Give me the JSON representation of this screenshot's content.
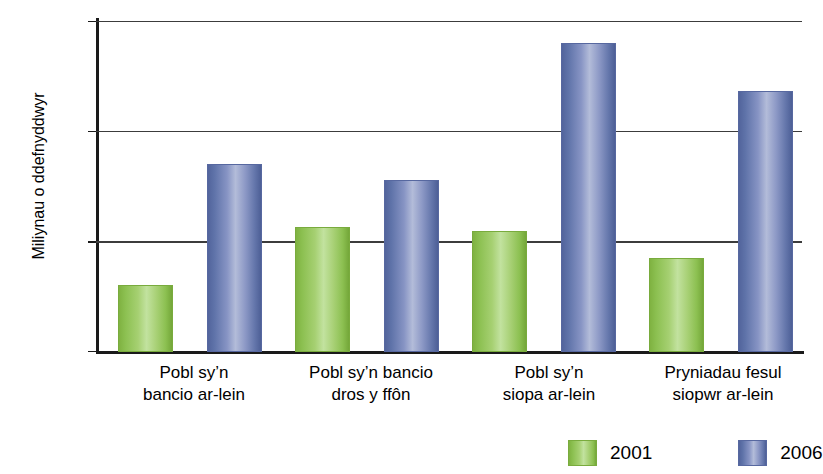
{
  "chart_data": {
    "type": "bar",
    "title": "",
    "xlabel": "",
    "ylabel": "Miliynau o ddefnyddwyr",
    "ylim": [
      0,
      30
    ],
    "yticks": [
      0,
      10,
      20,
      30
    ],
    "ytick_labels": [
      "0",
      "10",
      "20",
      "30"
    ],
    "grid": true,
    "legend_position": "bottom-right",
    "categories": [
      "Pobl sy'n bancio ar-lein",
      "Pobl sy'n bancio dros y ffôn",
      "Pobl sy'n siopa ar-lein",
      "Pryniadau fesul siopwr ar-lein"
    ],
    "category_lines": [
      {
        "line1": "Pobl sy’n",
        "line2": "bancio ar-lein"
      },
      {
        "line1": "Pobl sy’n bancio",
        "line2": "dros y ffôn"
      },
      {
        "line1": "Pobl sy’n",
        "line2": "siopa ar-lein"
      },
      {
        "line1": "Pryniadau fesul",
        "line2": "siopwr ar-lein"
      }
    ],
    "series": [
      {
        "name": "2001",
        "color": "#8CC051",
        "values": [
          6.1,
          11.3,
          11.0,
          8.5
        ]
      },
      {
        "name": "2006",
        "color": "#5F73A9",
        "values": [
          17.0,
          15.6,
          28.0,
          23.7
        ]
      }
    ]
  },
  "legend": {
    "items": [
      {
        "label": "2001",
        "color": "#8CC051"
      },
      {
        "label": "2006",
        "color": "#5F73A9"
      }
    ]
  },
  "axes": {
    "y_title": "Miliynau o ddefnyddwyr",
    "y_tick_0": "0",
    "y_tick_1": "10",
    "y_tick_2": "20",
    "y_tick_3": "30"
  }
}
